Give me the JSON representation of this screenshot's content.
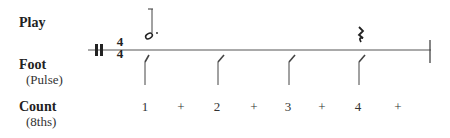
{
  "rows": {
    "play": {
      "label": "Play"
    },
    "foot": {
      "label": "Foot",
      "sub": "(Pulse)"
    },
    "count": {
      "label": "Count",
      "sub": "(8ths)"
    }
  },
  "time_signature": {
    "top": "4",
    "bottom": "4"
  },
  "notes": [
    {
      "type": "dotted-half-note",
      "beat": 1
    },
    {
      "type": "quarter-rest",
      "beat": 4
    }
  ],
  "pulse_beats": [
    1,
    2,
    3,
    4
  ],
  "counts": [
    {
      "text": "1",
      "x": 145
    },
    {
      "text": "+",
      "x": 181
    },
    {
      "text": "2",
      "x": 217
    },
    {
      "text": "+",
      "x": 254
    },
    {
      "text": "3",
      "x": 288
    },
    {
      "text": "+",
      "x": 322
    },
    {
      "text": "4",
      "x": 358
    },
    {
      "text": "+",
      "x": 398
    }
  ]
}
